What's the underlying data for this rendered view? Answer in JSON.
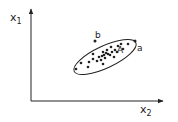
{
  "diagram": {
    "title": "",
    "axes": {
      "y_label": "x",
      "y_sub": "1",
      "x_label": "x",
      "x_sub": "2"
    },
    "ellipse": {
      "cx": 105,
      "cy": 57,
      "rx": 34,
      "ry": 11,
      "rotate": -25
    },
    "cluster_points": [
      [
        76,
        69
      ],
      [
        81,
        63
      ],
      [
        88,
        67
      ],
      [
        89,
        62
      ],
      [
        93,
        59
      ],
      [
        93,
        54
      ],
      [
        97,
        61
      ],
      [
        101,
        60
      ],
      [
        102,
        56
      ],
      [
        103,
        52
      ],
      [
        104,
        55
      ],
      [
        105,
        58
      ],
      [
        107,
        50
      ],
      [
        108,
        54
      ],
      [
        110,
        55
      ],
      [
        111,
        47
      ],
      [
        112,
        52
      ],
      [
        114,
        57
      ],
      [
        115,
        50
      ],
      [
        117,
        52
      ],
      [
        118,
        46
      ],
      [
        121,
        44
      ],
      [
        123,
        49
      ],
      [
        128,
        44
      ],
      [
        103,
        64
      ],
      [
        99,
        57
      ],
      [
        106,
        53
      ]
    ],
    "outliers": [
      {
        "id": "b",
        "x": 95,
        "y": 41,
        "label": "b"
      },
      {
        "id": "a",
        "x": 135,
        "y": 41,
        "label": "a"
      }
    ],
    "center_label": {
      "text": "A",
      "x": 121,
      "y": 51
    },
    "colors": {
      "ink": "#222222",
      "background": "#ffffff"
    }
  }
}
